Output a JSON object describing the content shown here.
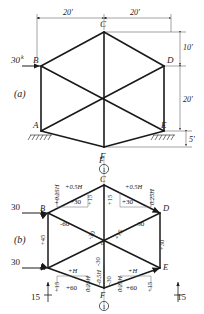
{
  "figure": {
    "panel_a_label": "(a)",
    "panel_b_label": "(b)"
  },
  "panel_a": {
    "joints": [
      "A",
      "B",
      "C",
      "D",
      "E",
      "F"
    ],
    "load": {
      "value": "30",
      "exponent": "k"
    },
    "dimensions": {
      "top_left_span": "20'",
      "top_right_span": "20'",
      "upper_height": "10'",
      "mid_height": "20'",
      "lower_height": "5'"
    }
  },
  "panel_b": {
    "joints": [
      "A",
      "B",
      "C",
      "D",
      "E",
      "F"
    ],
    "section_marker_top": "1",
    "section_marker_bottom": "1",
    "loads": {
      "at_B": "30",
      "at_A": "30"
    },
    "reactions": {
      "left": "15",
      "right": "15"
    },
    "members": {
      "bc_shear": "+0.5H",
      "cd_shear": "+0.5H",
      "b_moment": "+0.25H",
      "d_moment": "0.25H",
      "bc_axial": "+30",
      "cd_axial": "+30",
      "c_left_vert": "+15",
      "c_right_vert": "+15",
      "diag_bo": "-60",
      "diag_do": "-30",
      "diag_center_left": "-30",
      "diag_center_right": "+15",
      "col_ab": "+45",
      "col_de": "+30",
      "c_center_upper": "-30",
      "af_shear": "+H",
      "fe_shear": "+H",
      "a_moment": "0.25H",
      "e_moment": "0.25H",
      "af_axial": "+60",
      "fe_axial": "+60",
      "a_vert": "+15",
      "e_vert": "+15",
      "f_left_vert": "-0.5H",
      "f_right_vert": "-30",
      "center_vert_lower": "-30"
    }
  },
  "colors": {
    "ink": "#1a1a1a",
    "thin": "#444444"
  }
}
